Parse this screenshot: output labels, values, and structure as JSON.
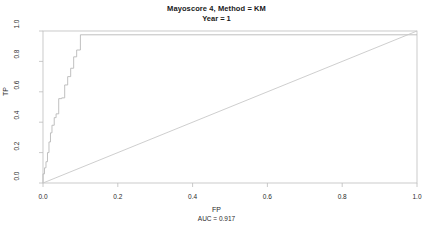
{
  "titles": {
    "main": "Mayoscore 4, Method = KM",
    "sub": "Year = 1"
  },
  "axes": {
    "xlabel": "FP",
    "ylabel": "TP",
    "annotation": "AUC = 0.917",
    "xticks": [
      "0.0",
      "0.2",
      "0.4",
      "0.6",
      "0.8",
      "1.0"
    ],
    "yticks": [
      "0.0",
      "0.2",
      "0.4",
      "0.6",
      "0.8",
      "1.0"
    ]
  },
  "colors": {
    "curve": "#b9b9b9",
    "diagonal": "#c8c8c8",
    "box": "#bdbdbd",
    "background": "#ffffff",
    "text": "#1a1a1a"
  },
  "chart_data": {
    "type": "line",
    "title": "Mayoscore 4, Method = KM",
    "subtitle": "Year = 1",
    "xlabel": "FP",
    "ylabel": "TP",
    "annotation": "AUC = 0.917",
    "auc": 0.917,
    "xlim": [
      0,
      1
    ],
    "ylim": [
      0,
      1
    ],
    "grid": false,
    "legend": null,
    "series": [
      {
        "name": "ROC curve",
        "style": "step",
        "x": [
          0.0,
          0.0,
          0.004,
          0.004,
          0.008,
          0.008,
          0.012,
          0.012,
          0.016,
          0.016,
          0.02,
          0.02,
          0.024,
          0.024,
          0.03,
          0.03,
          0.035,
          0.035,
          0.042,
          0.042,
          0.05,
          0.05,
          0.058,
          0.058,
          0.066,
          0.066,
          0.074,
          0.074,
          0.082,
          0.082,
          0.09,
          0.09,
          0.1,
          0.1,
          1.0
        ],
        "y": [
          0.0,
          0.06,
          0.06,
          0.1,
          0.1,
          0.14,
          0.14,
          0.2,
          0.2,
          0.27,
          0.27,
          0.33,
          0.33,
          0.38,
          0.38,
          0.43,
          0.43,
          0.455,
          0.455,
          0.555,
          0.555,
          0.56,
          0.56,
          0.645,
          0.645,
          0.7,
          0.7,
          0.755,
          0.755,
          0.83,
          0.83,
          0.875,
          0.875,
          0.975,
          0.975
        ]
      },
      {
        "name": "reference diagonal",
        "style": "line",
        "x": [
          0.0,
          1.0
        ],
        "y": [
          0.0,
          1.0
        ]
      }
    ]
  }
}
